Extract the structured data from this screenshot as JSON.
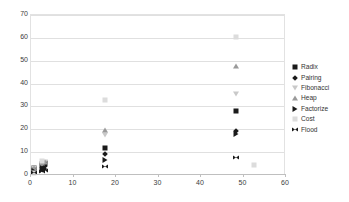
{
  "chart_data": {
    "type": "scatter",
    "title": "",
    "xlabel": "",
    "ylabel": "",
    "xlim": [
      0,
      60
    ],
    "ylim": [
      0,
      70
    ],
    "xticks": [
      0,
      10,
      20,
      30,
      40,
      50,
      60
    ],
    "yticks": [
      0,
      10,
      20,
      30,
      40,
      50,
      60,
      70
    ],
    "grid": "horizontal",
    "legend_position": "right",
    "series": [
      {
        "name": "Radix",
        "marker": "square",
        "color": "#1a1a1a",
        "points": [
          {
            "x": 0.6,
            "y": 3.2
          },
          {
            "x": 2.6,
            "y": 4.6
          },
          {
            "x": 3.3,
            "y": 5.2
          },
          {
            "x": 17.3,
            "y": 12.0
          },
          {
            "x": 48.2,
            "y": 27.8
          }
        ]
      },
      {
        "name": "Pairing",
        "marker": "diamond",
        "color": "#1a1a1a",
        "points": [
          {
            "x": 0.6,
            "y": 2.3
          },
          {
            "x": 2.7,
            "y": 3.4
          },
          {
            "x": 3.3,
            "y": 3.9
          },
          {
            "x": 17.3,
            "y": 9.0
          },
          {
            "x": 48.2,
            "y": 19.2
          }
        ]
      },
      {
        "name": "Fibonacci",
        "marker": "triangle-down",
        "color": "#c9c9c9",
        "points": [
          {
            "x": 0.6,
            "y": 3.0
          },
          {
            "x": 2.7,
            "y": 5.0
          },
          {
            "x": 3.3,
            "y": 5.6
          },
          {
            "x": 17.3,
            "y": 17.5
          },
          {
            "x": 48.2,
            "y": 35.5
          }
        ]
      },
      {
        "name": "Heap",
        "marker": "triangle-up",
        "color": "#9a9a9a",
        "points": [
          {
            "x": 0.6,
            "y": 3.1
          },
          {
            "x": 2.7,
            "y": 5.2
          },
          {
            "x": 3.3,
            "y": 5.8
          },
          {
            "x": 17.3,
            "y": 19.5
          },
          {
            "x": 48.2,
            "y": 47.5
          }
        ]
      },
      {
        "name": "Factorize",
        "marker": "triangle-right",
        "color": "#1a1a1a",
        "points": [
          {
            "x": 0.6,
            "y": 1.6
          },
          {
            "x": 2.7,
            "y": 2.4
          },
          {
            "x": 3.3,
            "y": 2.8
          },
          {
            "x": 17.3,
            "y": 6.6
          },
          {
            "x": 48.2,
            "y": 18.0
          }
        ]
      },
      {
        "name": "Cost",
        "marker": "dash",
        "color": "#dcdcdc",
        "points": [
          {
            "x": 0.6,
            "y": 1.0
          },
          {
            "x": 2.7,
            "y": 6.0
          },
          {
            "x": 17.3,
            "y": 33.0
          },
          {
            "x": 48.2,
            "y": 60.5
          },
          {
            "x": 52.5,
            "y": 4.5
          }
        ]
      },
      {
        "name": "Flood",
        "marker": "bowtie",
        "color": "#1a1a1a",
        "points": [
          {
            "x": 0.6,
            "y": 0.9
          },
          {
            "x": 2.7,
            "y": 1.4
          },
          {
            "x": 3.3,
            "y": 1.7
          },
          {
            "x": 17.3,
            "y": 3.6
          },
          {
            "x": 48.2,
            "y": 7.6
          }
        ]
      }
    ]
  }
}
